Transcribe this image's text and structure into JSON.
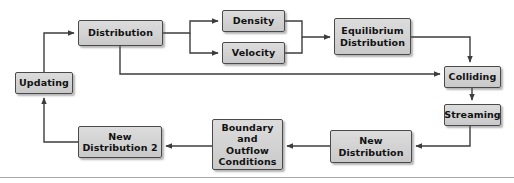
{
  "diagram": {
    "type": "flowchart",
    "canvas": {
      "width": 514,
      "height": 183
    },
    "style": {
      "node_fill": "#d4d4d4",
      "node_border": "#4a4a4a",
      "text_color": "#111111",
      "line_color": "#3c3c3c",
      "background": "#ffffff",
      "rule_color": "#a9a9a9"
    },
    "nodes": [
      {
        "id": "updating",
        "label": "Updating",
        "x": 15,
        "y": 72,
        "w": 58,
        "h": 22
      },
      {
        "id": "distribution",
        "label": "Distribution",
        "x": 78,
        "y": 20,
        "w": 85,
        "h": 26
      },
      {
        "id": "density",
        "label": "Density",
        "x": 222,
        "y": 10,
        "w": 63,
        "h": 22
      },
      {
        "id": "velocity",
        "label": "Velocity",
        "x": 222,
        "y": 42,
        "w": 63,
        "h": 22
      },
      {
        "id": "equilibrium",
        "label": "Equilibrium\nDistribution",
        "x": 334,
        "y": 18,
        "w": 77,
        "h": 37
      },
      {
        "id": "colliding",
        "label": "Colliding",
        "x": 444,
        "y": 66,
        "w": 57,
        "h": 22
      },
      {
        "id": "streaming",
        "label": "Streaming",
        "x": 444,
        "y": 104,
        "w": 57,
        "h": 22
      },
      {
        "id": "newdist",
        "label": "New\nDistribution",
        "x": 330,
        "y": 130,
        "w": 82,
        "h": 33
      },
      {
        "id": "boundary",
        "label": "Boundary and\nOutflow\nConditions",
        "x": 212,
        "y": 119,
        "w": 71,
        "h": 51
      },
      {
        "id": "newdist2",
        "label": "New\nDistribution 2",
        "x": 78,
        "y": 126,
        "w": 84,
        "h": 32
      }
    ],
    "edges": [
      {
        "from": "updating",
        "to": "distribution",
        "path": "M 44 72 L 44 33 L 74 33",
        "arrow": "right"
      },
      {
        "from": "distribution",
        "to": "density",
        "path": "M 163 33 L 190 33 L 190 21 L 218 21",
        "arrow": "right"
      },
      {
        "from": "distribution",
        "to": "velocity",
        "path": "M 190 33 L 190 53 L 218 53",
        "arrow": "right"
      },
      {
        "from": "density",
        "to": "equilibrium",
        "path": "M 285 21 L 302 21 L 302 37 L 330 37",
        "arrow": "right"
      },
      {
        "from": "velocity",
        "to": "equilibrium",
        "path": "M 285 53 L 302 53 L 302 37",
        "arrow": "none"
      },
      {
        "from": "equilibrium",
        "to": "colliding",
        "path": "M 411 37 L 470 37 L 470 62",
        "arrow": "down"
      },
      {
        "from": "distribution",
        "to": "colliding",
        "path": "M 120 46 L 120 74 L 440 74",
        "arrow": "right"
      },
      {
        "from": "colliding",
        "to": "streaming",
        "path": "M 472 88 L 472 100",
        "arrow": "down"
      },
      {
        "from": "streaming",
        "to": "newdist",
        "path": "M 470 126 L 470 146 L 416 146",
        "arrow": "right"
      },
      {
        "from": "newdist",
        "to": "boundary",
        "path": "M 330 146 L 287 146",
        "arrow": "right"
      },
      {
        "from": "boundary",
        "to": "newdist2",
        "path": "M 212 146 L 166 146",
        "arrow": "right"
      },
      {
        "from": "newdist2",
        "to": "updating",
        "path": "M 78 142 L 44 142 L 44 98",
        "arrow": "up"
      }
    ],
    "rule": {
      "y": 177
    }
  }
}
